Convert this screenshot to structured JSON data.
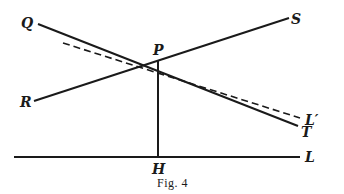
{
  "figure": {
    "caption": "Fig. 4",
    "points": {
      "Q": {
        "label": "Q"
      },
      "P": {
        "label": "P"
      },
      "S": {
        "label": "S"
      },
      "R": {
        "label": "R"
      },
      "T": {
        "label": "T"
      },
      "L_prime": {
        "label": "L′"
      },
      "H": {
        "label": "H"
      },
      "L": {
        "label": "L"
      }
    },
    "lines": [
      {
        "name": "QT",
        "style": "solid",
        "from": "Q",
        "to": "T",
        "through": "P"
      },
      {
        "name": "RS",
        "style": "solid",
        "from": "R",
        "to": "S",
        "through": "P"
      },
      {
        "name": "PL'",
        "style": "dashed",
        "to": "L′",
        "through": "P"
      },
      {
        "name": "PH",
        "style": "solid",
        "from": "P",
        "to": "H"
      },
      {
        "name": "HL",
        "style": "solid",
        "to": "L",
        "through": "H"
      }
    ]
  }
}
